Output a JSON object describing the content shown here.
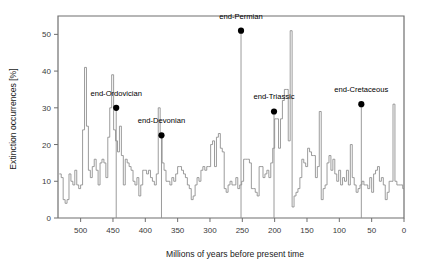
{
  "chart_data": {
    "type": "line",
    "title": "",
    "xlabel": "Millions of years before present time",
    "ylabel": "Extinction occurrences [%]",
    "xlim": [
      535,
      0
    ],
    "ylim": [
      0,
      55
    ],
    "x_reversed": true,
    "grid": false,
    "legend": "none",
    "xticks": [
      500,
      450,
      400,
      350,
      300,
      250,
      200,
      150,
      100,
      50,
      0
    ],
    "xtick_labels": [
      "500",
      "450",
      "400",
      "350",
      "300",
      "250",
      "200",
      "150",
      "100",
      "50",
      "0"
    ],
    "xminor_step": 10,
    "yticks": [
      0,
      10,
      20,
      30,
      40,
      50
    ],
    "ytick_labels": [
      "0",
      "10",
      "20",
      "30",
      "40",
      "50"
    ],
    "series_name": "Extinction occurrences",
    "line_color": "#8a8a8a",
    "marker_color": "#000000",
    "step_style": "post",
    "x": [
      533,
      530,
      527,
      524,
      521,
      518,
      515,
      512,
      509,
      506,
      503,
      500,
      497,
      494,
      491,
      488,
      485,
      482,
      479,
      476,
      473,
      470,
      467,
      464,
      461,
      458,
      455,
      452,
      449,
      446,
      443,
      440,
      437,
      434,
      431,
      428,
      425,
      422,
      419,
      416,
      413,
      410,
      407,
      404,
      401,
      398,
      395,
      392,
      389,
      386,
      383,
      380,
      377,
      374,
      371,
      368,
      365,
      362,
      359,
      356,
      353,
      350,
      347,
      344,
      341,
      338,
      335,
      332,
      329,
      326,
      323,
      320,
      317,
      314,
      311,
      308,
      305,
      302,
      299,
      296,
      293,
      290,
      287,
      284,
      281,
      278,
      275,
      272,
      269,
      266,
      263,
      260,
      257,
      254,
      251,
      248,
      245,
      242,
      239,
      236,
      233,
      230,
      227,
      224,
      221,
      218,
      215,
      212,
      209,
      206,
      203,
      200,
      197,
      194,
      191,
      188,
      185,
      182,
      179,
      176,
      173,
      170,
      167,
      164,
      161,
      158,
      155,
      152,
      149,
      146,
      143,
      140,
      137,
      134,
      131,
      128,
      125,
      122,
      119,
      116,
      113,
      110,
      107,
      104,
      101,
      98,
      95,
      92,
      89,
      86,
      83,
      80,
      77,
      74,
      71,
      68,
      65,
      62,
      59,
      56,
      53,
      50,
      47,
      44,
      41,
      38,
      35,
      32,
      29,
      26,
      23,
      20,
      17,
      14,
      11,
      8,
      5,
      2,
      0
    ],
    "y": [
      12,
      11,
      5,
      4,
      5,
      12,
      10,
      9,
      13,
      9,
      8,
      9,
      24,
      41,
      25,
      13,
      11,
      14,
      16,
      13,
      9,
      15,
      16,
      15,
      11,
      22,
      30,
      39,
      24,
      21,
      18,
      25,
      17,
      9,
      16,
      15,
      14,
      13,
      10,
      9,
      11,
      6,
      9,
      13,
      13,
      12,
      13,
      11,
      10,
      9,
      12,
      30,
      22,
      15,
      13,
      10,
      10,
      9,
      11,
      10,
      12,
      14,
      14,
      13,
      12,
      11,
      9,
      8,
      5,
      6,
      9,
      11,
      10,
      13,
      14,
      13,
      14,
      14,
      20,
      21,
      14,
      22,
      23,
      19,
      18,
      8,
      7,
      9,
      10,
      9,
      9,
      11,
      8,
      9,
      10,
      16,
      16,
      16,
      15,
      8,
      8,
      7,
      6,
      14,
      14,
      11,
      12,
      13,
      11,
      15,
      19,
      27,
      27,
      19,
      27,
      32,
      35,
      35,
      21,
      51,
      3,
      6,
      7,
      8,
      11,
      16,
      15,
      14,
      19,
      18,
      17,
      17,
      11,
      14,
      29,
      5,
      8,
      9,
      15,
      17,
      13,
      16,
      12,
      10,
      13,
      9,
      11,
      10,
      13,
      9,
      20,
      11,
      9,
      7,
      8,
      9,
      10,
      9,
      9,
      8,
      11,
      7,
      12,
      13,
      14,
      10,
      11,
      9,
      5,
      7,
      10,
      10,
      31,
      10,
      9,
      9,
      9,
      8,
      8,
      9,
      9,
      19,
      11,
      8,
      7,
      6,
      7,
      6,
      7,
      9
    ],
    "annotations": [
      {
        "label": "end-Ordovician",
        "x": 445,
        "y": 30,
        "label_dx": 0,
        "label_dy": -12
      },
      {
        "label": "end-Devonian",
        "x": 375,
        "y": 22.5,
        "label_dx": 0,
        "label_dy": -12
      },
      {
        "label": "end-Permian",
        "x": 252,
        "y": 51,
        "label_dx": 0,
        "label_dy": -12
      },
      {
        "label": "end-Triassic",
        "x": 201,
        "y": 29,
        "label_dx": 0,
        "label_dy": -12
      },
      {
        "label": "end-Cretaceous",
        "x": 66,
        "y": 31,
        "label_dx": 0,
        "label_dy": -12
      }
    ]
  }
}
